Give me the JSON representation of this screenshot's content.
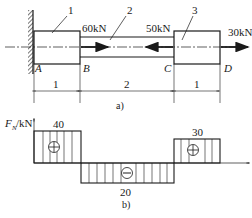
{
  "figure_a": {
    "caption": "a)",
    "segment_numbers": [
      "1",
      "2",
      "3"
    ],
    "points": [
      "A",
      "B",
      "C",
      "D"
    ],
    "forces": [
      {
        "label": "60kN",
        "at": "B",
        "direction": "right"
      },
      {
        "label": "50kN",
        "at": "C",
        "direction": "left"
      },
      {
        "label": "30kN",
        "at": "D",
        "direction": "right"
      }
    ],
    "dimensions": [
      "1",
      "2",
      "1"
    ]
  },
  "figure_b": {
    "caption": "b)",
    "axis_label_main": "F",
    "axis_label_sub": "N",
    "axis_label_unit": "/kN",
    "values": [
      {
        "segment": "AB",
        "value": "40",
        "sign": "+"
      },
      {
        "segment": "BC",
        "value": "20",
        "sign": "−"
      },
      {
        "segment": "CD",
        "value": "30",
        "sign": "+"
      }
    ]
  },
  "colors": {
    "ink": "#1a1a1a",
    "background": "#ffffff"
  }
}
